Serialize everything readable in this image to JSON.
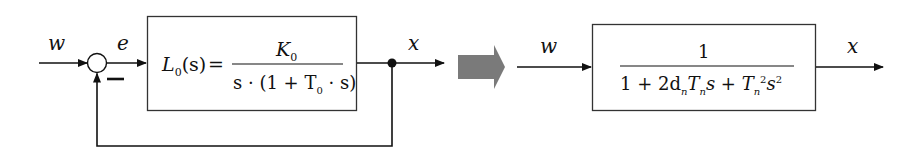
{
  "diagram": {
    "type": "block-diagram",
    "left": {
      "input_label": "w",
      "error_label": "e",
      "output_label": "x",
      "summing_junction": {
        "plus_input": "w",
        "minus_sign": "−"
      },
      "open_loop_block": {
        "lhs": "L",
        "lhs_sub": "0",
        "lhs_arg": "(s)",
        "equals": "=",
        "numerator": "K",
        "numerator_sub": "0",
        "denominator_pre": "s · (1 + T",
        "denominator_sub": "0",
        "denominator_post": " · s)"
      },
      "feedback": "unity negative feedback"
    },
    "transform_arrow": "equivalent-to",
    "right": {
      "input_label": "w",
      "output_label": "x",
      "closed_loop_block": {
        "numerator": "1",
        "den_1": "1 + 2d",
        "den_1_sub": "n",
        "den_2": "T",
        "den_2_sub": "n",
        "den_3": "s + T",
        "den_3_sub": "n",
        "den_3_sup": "2",
        "den_4": "s",
        "den_4_sup": "2"
      }
    },
    "colors": {
      "line": "#111111",
      "transform_arrow": "#7a7a7a",
      "background": "#ffffff"
    }
  }
}
